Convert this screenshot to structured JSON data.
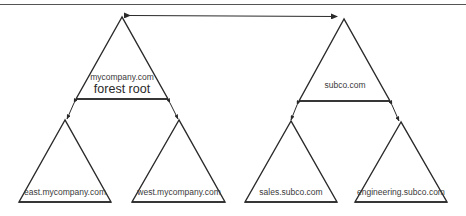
{
  "diagram": {
    "type": "active-directory-forest",
    "trust_link": {
      "from": "mycompany.com",
      "to": "subco.com",
      "style": "bidirectional-arrow"
    },
    "trees": [
      {
        "root": {
          "name": "mycompany.com",
          "subtitle": "forest root"
        },
        "children": [
          {
            "name": "east.mycompany.com"
          },
          {
            "name": "west.mycompany.com"
          }
        ]
      },
      {
        "root": {
          "name": "subco.com"
        },
        "children": [
          {
            "name": "sales.subco.com"
          },
          {
            "name": "engineering.subco.com"
          }
        ]
      }
    ]
  },
  "labels": {
    "root1": "mycompany.com",
    "root1_sub": "forest root",
    "root2": "subco.com",
    "east": "east.mycompany.com",
    "west": "west.mycompany.com",
    "sales": "sales.subco.com",
    "engineering": "engineering.subco.com"
  },
  "colors": {
    "stroke": "#2a2a2a",
    "background": "#ffffff"
  }
}
